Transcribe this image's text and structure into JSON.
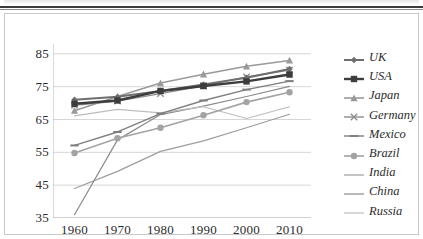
{
  "chart_data": {
    "type": "line",
    "title": "",
    "xlabel": "",
    "ylabel": "",
    "x": [
      1960,
      1970,
      1980,
      1990,
      2000,
      2010
    ],
    "xlim": [
      1955,
      2015
    ],
    "ylim": [
      35,
      88
    ],
    "yticks": [
      35,
      45,
      55,
      65,
      75,
      85
    ],
    "xticks": [
      1960,
      1970,
      1980,
      1990,
      2000,
      2010
    ],
    "grid": "horizontal",
    "legend_position": "right",
    "series": [
      {
        "name": "UK",
        "values": [
          71.0,
          71.9,
          73.7,
          75.7,
          77.7,
          80.4
        ],
        "color": "#6e6e6e",
        "marker": "diamond",
        "width": 2.0
      },
      {
        "name": "USA",
        "values": [
          69.8,
          70.8,
          73.7,
          75.2,
          76.6,
          78.7
        ],
        "color": "#3d3d3d",
        "marker": "square",
        "width": 2.4
      },
      {
        "name": "Japan",
        "values": [
          67.7,
          72.0,
          76.1,
          78.8,
          81.2,
          83.0
        ],
        "color": "#9a9a9a",
        "marker": "triangle",
        "width": 1.6
      },
      {
        "name": "Germany",
        "values": [
          69.3,
          70.6,
          72.9,
          75.3,
          78.0,
          80.1
        ],
        "color": "#8d8d8d",
        "marker": "cross",
        "width": 1.4
      },
      {
        "name": "Mexico",
        "values": [
          57.1,
          61.2,
          66.8,
          70.8,
          74.1,
          76.7
        ],
        "color": "#7f7f7f",
        "marker": "dash",
        "width": 1.4
      },
      {
        "name": "Brazil",
        "values": [
          54.8,
          59.3,
          62.5,
          66.3,
          70.3,
          73.3
        ],
        "color": "#a3a3a3",
        "marker": "dot",
        "width": 1.6
      },
      {
        "name": "India",
        "values": [
          44.0,
          49.2,
          55.3,
          58.5,
          62.5,
          66.6
        ],
        "color": "#9d9d9d",
        "marker": "none",
        "width": 1.2
      },
      {
        "name": "China",
        "values": [
          36.0,
          58.8,
          66.5,
          69.1,
          72.0,
          75.1
        ],
        "color": "#8b8b8b",
        "marker": "none",
        "width": 1.2
      },
      {
        "name": "Russia",
        "values": [
          66.1,
          68.1,
          67.0,
          68.9,
          65.3,
          68.9
        ],
        "color": "#bdbdbd",
        "marker": "none",
        "width": 1.2
      }
    ]
  },
  "axis": {
    "y_tick_labels": [
      "85",
      "75",
      "65",
      "55",
      "45",
      "35"
    ],
    "x_tick_labels": [
      "1960",
      "1970",
      "1980",
      "1990",
      "2000",
      "2010"
    ]
  },
  "legend": {
    "items": [
      {
        "label": "UK"
      },
      {
        "label": "USA"
      },
      {
        "label": "Japan"
      },
      {
        "label": "Germany"
      },
      {
        "label": "Mexico"
      },
      {
        "label": "Brazil"
      },
      {
        "label": "India"
      },
      {
        "label": "China"
      },
      {
        "label": "Russia"
      }
    ]
  },
  "colors": {
    "grid": "#d6d6d6",
    "axis": "#b5b5b5",
    "frame": "#c9c9c9",
    "text": "#2b2b2b"
  }
}
